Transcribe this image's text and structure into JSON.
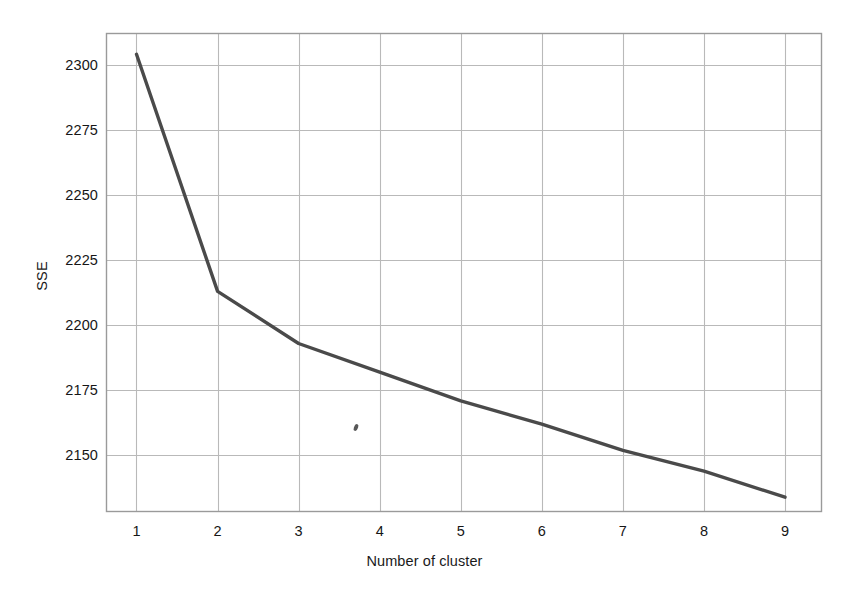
{
  "chart_data": {
    "type": "line",
    "title": "",
    "subtitle": "",
    "xlabel": "Number of cluster",
    "ylabel": "SSE",
    "x": [
      1,
      2,
      3,
      4,
      5,
      6,
      7,
      8,
      9
    ],
    "values": [
      2304,
      2213,
      2193,
      2182,
      2171,
      2162,
      2152,
      2144,
      2134
    ],
    "series": [
      {
        "name": "SSE",
        "values": [
          2304,
          2213,
          2193,
          2182,
          2171,
          2162,
          2152,
          2144,
          2134
        ]
      }
    ],
    "xtick_labels": [
      "1",
      "2",
      "3",
      "4",
      "5",
      "6",
      "7",
      "8",
      "9"
    ],
    "ytick_labels": [
      "2300",
      "2275",
      "2250",
      "2225",
      "2200",
      "2175",
      "2150"
    ],
    "yticks": [
      2300,
      2275,
      2250,
      2225,
      2200,
      2175,
      2150
    ],
    "xlim": [
      0.63,
      9.45
    ],
    "ylim": [
      2128.5,
      2312
    ],
    "grid": true,
    "legend": "none",
    "line_color": "#4a4a4a",
    "grid_color": "#b9b9b9",
    "frame_color": "#9a9a9a",
    "background_color": "#ffffff"
  },
  "axis": {
    "y_title": "SSE",
    "x_title": "Number of cluster"
  }
}
